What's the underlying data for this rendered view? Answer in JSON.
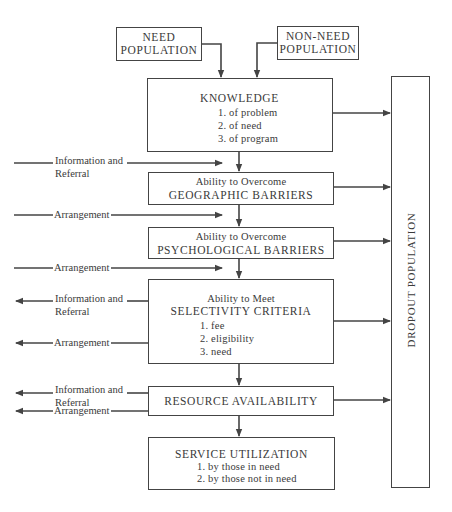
{
  "diagram": {
    "sources": {
      "need": [
        "NEED",
        "POPULATION"
      ],
      "non_need": [
        "NON-NEED",
        "POPULATION"
      ]
    },
    "knowledge": {
      "title": "KNOWLEDGE",
      "items": [
        "1.  of problem",
        "2.  of need",
        "3.  of program"
      ]
    },
    "geographic": {
      "sub": "Ability to Overcome",
      "title": "GEOGRAPHIC BARRIERS"
    },
    "psychological": {
      "sub": "Ability to Overcome",
      "title": "PSYCHOLOGICAL BARRIERS"
    },
    "selectivity": {
      "sub": "Ability to Meet",
      "title": "SELECTIVITY CRITERIA",
      "items": [
        "1.  fee",
        "2.  eligibility",
        "3.  need"
      ]
    },
    "resource": {
      "title": "RESOURCE AVAILABILITY"
    },
    "service": {
      "title": "SERVICE UTILIZATION",
      "items": [
        "1.  by those in need",
        "2.  by those not in need"
      ]
    },
    "dropout": {
      "title": "DROPOUT POPULATION"
    },
    "side_labels": {
      "info_ref_1": [
        "Information and",
        "Referral"
      ],
      "arr_1": "Arrangement",
      "arr_2": "Arrangement",
      "info_ref_2": [
        "Information and",
        "Referral"
      ],
      "arr_3": "Arrangement",
      "info_ref_3": [
        "Information and",
        "Referral"
      ],
      "arr_4": "Arrangement"
    },
    "colors": {
      "line": "#444444",
      "text": "#3a3a3a",
      "background": "#ffffff"
    }
  }
}
